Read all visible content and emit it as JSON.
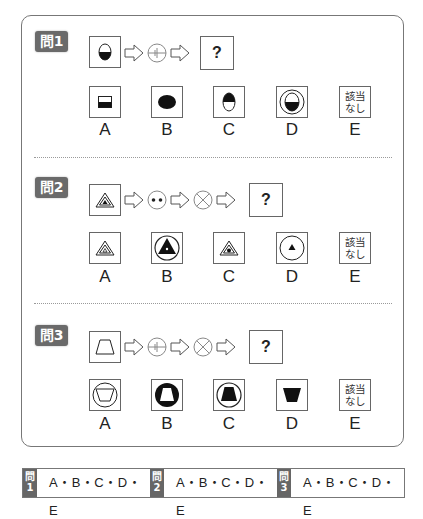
{
  "problems": [
    {
      "tag": "問1",
      "sequence": [
        "half-filled-oval",
        "arrow",
        "circle-split-operator",
        "arrow",
        "answer-slot"
      ],
      "question_mark": "?",
      "options": [
        {
          "label": "A",
          "figure": "small-square-bottom-half-filled"
        },
        {
          "label": "B",
          "figure": "filled-oval"
        },
        {
          "label": "C",
          "figure": "oval-top-half-filled"
        },
        {
          "label": "D",
          "figure": "circle-around-oval-bottom-half-filled"
        },
        {
          "label": "E",
          "text_line1": "該当",
          "text_line2": "なし"
        }
      ]
    },
    {
      "tag": "問2",
      "sequence": [
        "triangle-with-filled-inner-triangle",
        "arrow",
        "circle-two-dots-operator",
        "arrow",
        "circle-x-operator",
        "arrow",
        "answer-slot"
      ],
      "question_mark": "?",
      "options": [
        {
          "label": "A",
          "figure": "triangle-with-small-outline-triangle"
        },
        {
          "label": "B",
          "figure": "circle-with-filled-triangle-and-dot"
        },
        {
          "label": "C",
          "figure": "triangle-with-dot"
        },
        {
          "label": "D",
          "figure": "circle-with-small-filled-triangle"
        },
        {
          "label": "E",
          "text_line1": "該当",
          "text_line2": "なし"
        }
      ]
    },
    {
      "tag": "問3",
      "sequence": [
        "trapezoid-outline",
        "arrow",
        "circle-split-operator",
        "arrow",
        "circle-x-operator",
        "arrow",
        "answer-slot"
      ],
      "question_mark": "?",
      "options": [
        {
          "label": "A",
          "figure": "circle-with-inverted-trapezoid-outline"
        },
        {
          "label": "B",
          "figure": "filled-circle-with-white-trapezoid"
        },
        {
          "label": "C",
          "figure": "circle-with-filled-trapezoid"
        },
        {
          "label": "D",
          "figure": "filled-inverted-trapezoid"
        },
        {
          "label": "E",
          "text_line1": "該当",
          "text_line2": "なし"
        }
      ]
    }
  ],
  "answer_sheet": [
    {
      "tag_top": "問",
      "tag_num": "1",
      "choices": "A・B・C・D・E"
    },
    {
      "tag_top": "問",
      "tag_num": "2",
      "choices": "A・B・C・D・E"
    },
    {
      "tag_top": "問",
      "tag_num": "3",
      "choices": "A・B・C・D・E"
    }
  ],
  "colors": {
    "tag_bg": "#6a6a6a",
    "border": "#666666",
    "fill": "#111111"
  }
}
